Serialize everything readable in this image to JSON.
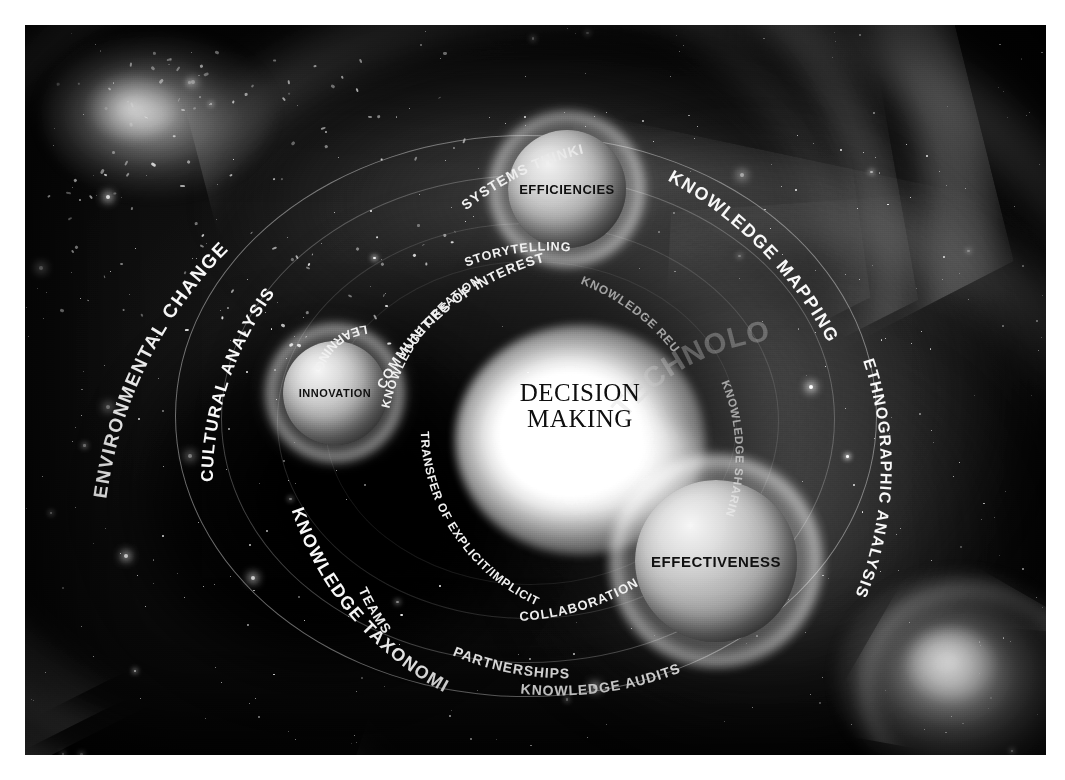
{
  "figure": {
    "kind": "conceptual-diagram",
    "theme": "cosmic-knowledge-management-universe",
    "palette": {
      "background": "#ffffff",
      "space": "#0a0a0a",
      "nebula": "#9a9a9a",
      "label": "#f4f4f4",
      "core": "#ffffff",
      "core_text": "#121212"
    }
  },
  "center": {
    "line1": "DECISION",
    "line2": "MAKING"
  },
  "spheres": [
    {
      "id": "efficiencies",
      "label": "EFFICIENCIES"
    },
    {
      "id": "innovation",
      "label": "INNOVATION"
    },
    {
      "id": "effectiveness",
      "label": "EFFECTIVENESS"
    }
  ],
  "orbit_labels": {
    "outer": [
      {
        "id": "environmental-change",
        "label": "ENVIRONMENTAL CHANGE"
      },
      {
        "id": "knowledge-mapping",
        "label": "KNOWLEDGE MAPPING"
      },
      {
        "id": "ethnographic-analysis",
        "label": "ETHNOGRAPHIC ANALYSIS"
      },
      {
        "id": "knowledge-taxonomies",
        "label": "KNOWLEDGE TAXONOMIES"
      },
      {
        "id": "cultural-analysis",
        "label": "CULTURAL ANALYSIS"
      }
    ],
    "middle": [
      {
        "id": "systems-thinking",
        "label": "SYSTEMS THINKING"
      },
      {
        "id": "communities-of-interest",
        "label": "COMMUNITIES OF INTEREST"
      },
      {
        "id": "knowledge-audits",
        "label": "KNOWLEDGE AUDITS"
      },
      {
        "id": "teams",
        "label": "TEAMS"
      },
      {
        "id": "partnerships",
        "label": "PARTNERSHIPS"
      },
      {
        "id": "collaboration",
        "label": "COLLABORATION"
      }
    ],
    "inner": [
      {
        "id": "knowledge-creation",
        "label": "KNOWLEDGE CREATION"
      },
      {
        "id": "storytelling",
        "label": "STORYTELLING"
      },
      {
        "id": "knowledge-reuse",
        "label": "KNOWLEDGE REUSE"
      },
      {
        "id": "knowledge-sharing",
        "label": "KNOWLEDGE SHARING"
      },
      {
        "id": "transfer-explicit-implicit",
        "label": "TRANSFER OF EXPLICIT/IMPLICIT"
      },
      {
        "id": "learning",
        "label": "LEARNING"
      }
    ],
    "watermark": [
      {
        "id": "technology",
        "label": "TECHNOLOGY"
      }
    ]
  }
}
